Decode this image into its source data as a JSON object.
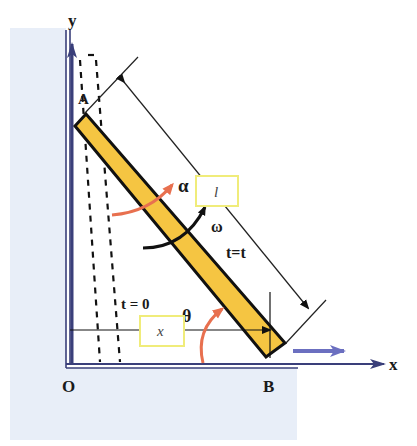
{
  "diagram": {
    "labels": {
      "y_axis": "y",
      "x_axis": "x",
      "origin": "O",
      "point_a": "A",
      "point_b": "B",
      "alpha": "α",
      "omega": "ω",
      "theta": "θ",
      "time_initial": "t = 0",
      "time_current": "t=t",
      "length_box": "l",
      "x_box": "x"
    },
    "colors": {
      "background_panel": "#e8eef8",
      "ladder_fill": "#f5c542",
      "ladder_stroke": "#111111",
      "axis": "#3a3f7a",
      "velocity_arrow": "#6b6fc0",
      "angle_arc": "#e8704f",
      "label_box_border": "#f0ec7a"
    }
  }
}
